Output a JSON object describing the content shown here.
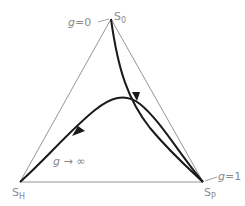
{
  "vertices": {
    "top": {
      "base": "S",
      "sub": "0"
    },
    "left": {
      "base": "S",
      "sub": "H"
    },
    "right": {
      "base": "S",
      "sub": "P"
    }
  },
  "annotations": {
    "g0": {
      "var": "g",
      "rest": "=0"
    },
    "g1": {
      "var": "g",
      "rest": "=1"
    },
    "ginf": {
      "var": "g",
      "rest": " → ∞"
    }
  },
  "colors": {
    "edge": "#7a7a7a",
    "curve": "#1a1a1a",
    "label": "#8a8a8a"
  }
}
